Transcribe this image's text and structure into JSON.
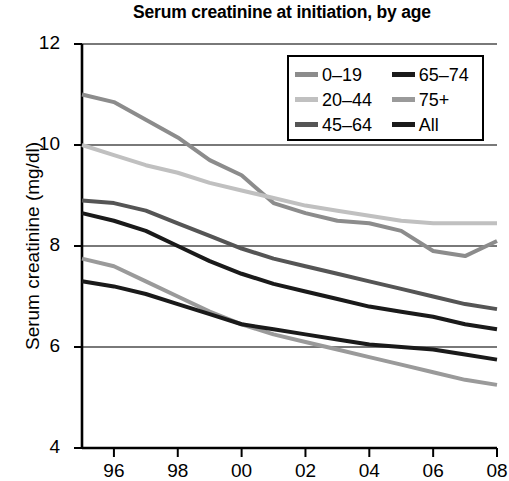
{
  "chart_data": {
    "type": "line",
    "title": "Serum creatinine at initiation, by age",
    "xlabel": "",
    "ylabel": "Serum creatinine (mg/dl)",
    "xlim": [
      1995,
      2008
    ],
    "ylim": [
      4,
      12
    ],
    "grid": true,
    "grid_axis": "y",
    "legend_position": "top-right",
    "x": [
      1995,
      1996,
      1997,
      1998,
      1999,
      2000,
      2001,
      2002,
      2003,
      2004,
      2005,
      2006,
      2007,
      2008
    ],
    "xtick_values": [
      1996,
      1998,
      2000,
      2002,
      2004,
      2006,
      2008
    ],
    "xtick_labels": [
      "96",
      "98",
      "00",
      "02",
      "04",
      "06",
      "08"
    ],
    "ytick_labels": [
      "4",
      "6",
      "8",
      "10",
      "12"
    ],
    "ytick_values": [
      4,
      6,
      8,
      10,
      12
    ],
    "series": [
      {
        "name": "0–19",
        "color": "#8c8c8c",
        "width": 4,
        "values": [
          11.0,
          10.85,
          10.5,
          10.15,
          9.7,
          9.4,
          8.85,
          8.65,
          8.5,
          8.45,
          8.3,
          7.9,
          7.8,
          8.1
        ]
      },
      {
        "name": "20–44",
        "color": "#c0c0c0",
        "width": 4,
        "values": [
          10.0,
          9.8,
          9.6,
          9.45,
          9.25,
          9.1,
          8.95,
          8.8,
          8.7,
          8.6,
          8.5,
          8.45,
          8.45,
          8.45
        ]
      },
      {
        "name": "45–64",
        "color": "#555555",
        "width": 4,
        "values": [
          8.9,
          8.85,
          8.7,
          8.45,
          8.2,
          7.95,
          7.75,
          7.6,
          7.45,
          7.3,
          7.15,
          7.0,
          6.85,
          6.75
        ]
      },
      {
        "name": "65–74",
        "color": "#1a1a1a",
        "width": 4,
        "values": [
          8.65,
          8.5,
          8.3,
          8.0,
          7.7,
          7.45,
          7.25,
          7.1,
          6.95,
          6.8,
          6.7,
          6.6,
          6.45,
          6.35
        ]
      },
      {
        "name": "75+",
        "color": "#9a9a9a",
        "width": 4,
        "values": [
          7.75,
          7.6,
          7.3,
          7.0,
          6.7,
          6.45,
          6.25,
          6.1,
          5.95,
          5.8,
          5.65,
          5.5,
          5.35,
          5.25
        ]
      },
      {
        "name": "All",
        "color": "#1a1a1a",
        "width": 4,
        "values": [
          7.3,
          7.2,
          7.05,
          6.85,
          6.65,
          6.45,
          6.35,
          6.25,
          6.15,
          6.05,
          6.0,
          5.95,
          5.85,
          5.75
        ]
      }
    ]
  },
  "legend": {
    "rows": [
      {
        "left": {
          "label": "0–19",
          "color": "#8c8c8c"
        },
        "right": {
          "label": "65–74",
          "color": "#1a1a1a"
        }
      },
      {
        "left": {
          "label": "20–44",
          "color": "#c0c0c0"
        },
        "right": {
          "label": "75+",
          "color": "#9a9a9a"
        }
      },
      {
        "left": {
          "label": "45–64",
          "color": "#555555"
        },
        "right": {
          "label": "All",
          "color": "#1a1a1a"
        }
      }
    ]
  }
}
